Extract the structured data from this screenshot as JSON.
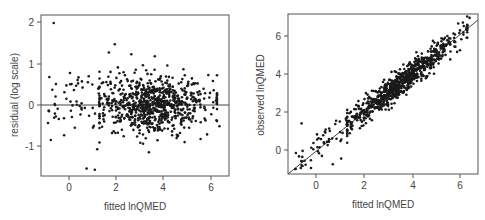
{
  "chart_data": [
    {
      "type": "scatter",
      "title": "",
      "xlabel": "fitted lnQMED",
      "ylabel": "residual (log scale)",
      "xlim": [
        -1.2,
        6.7
      ],
      "ylim": [
        -1.75,
        2.15
      ],
      "xticks": [
        0,
        2,
        4,
        6
      ],
      "yticks": [
        -1,
        0,
        1,
        2
      ],
      "reference_line": {
        "type": "horizontal",
        "y": 0
      },
      "grid": false,
      "legend": null,
      "notable_points": [
        {
          "x": -0.65,
          "y": 2.0
        },
        {
          "x": 1.95,
          "y": 1.48
        },
        {
          "x": 1.7,
          "y": 1.28
        },
        {
          "x": 2.65,
          "y": 1.24
        },
        {
          "x": 3.65,
          "y": 1.19
        },
        {
          "x": 0.75,
          "y": -1.55
        },
        {
          "x": 1.1,
          "y": -1.58
        },
        {
          "x": 1.2,
          "y": -1.08
        },
        {
          "x": 3.4,
          "y": -1.15
        },
        {
          "x": -0.85,
          "y": -0.15
        },
        {
          "x": 6.4,
          "y": -0.52
        }
      ],
      "description": "About 900 points scattered around residual 0, spread roughly -1 to +1, densest between fitted 2 and 5.5"
    },
    {
      "type": "scatter",
      "title": "",
      "xlabel": "fitted lnQMED",
      "ylabel": "observed lnQMED",
      "xlim": [
        -1.2,
        6.7
      ],
      "ylim": [
        -1.2,
        7.2
      ],
      "xticks": [
        0,
        2,
        4,
        6
      ],
      "yticks": [
        0,
        2,
        4,
        6
      ],
      "reference_line": {
        "type": "identity",
        "from": [
          -1.2,
          -1.2
        ],
        "to": [
          6.7,
          6.7
        ]
      },
      "grid": false,
      "legend": null,
      "notable_points": [
        {
          "x": -0.6,
          "y": 1.4
        },
        {
          "x": 0.7,
          "y": -0.75
        },
        {
          "x": 1.05,
          "y": -0.45
        },
        {
          "x": -0.85,
          "y": -1.0
        },
        {
          "x": 6.4,
          "y": 6.95
        },
        {
          "x": 6.0,
          "y": 5.25
        }
      ],
      "description": "About 900 points tightly clustered along the 1:1 line from about -1 to 7"
    }
  ],
  "left_plot": {
    "ylabel": "residual (log scale)",
    "xlabel": "fitted lnQMED",
    "xtick_labels": [
      "0",
      "2",
      "4",
      "6"
    ],
    "ytick_labels": [
      "-1",
      "0",
      "1",
      "2"
    ]
  },
  "right_plot": {
    "ylabel": "observed lnQMED",
    "xlabel": "fitted lnQMED",
    "xtick_labels": [
      "0",
      "2",
      "4",
      "6"
    ],
    "ytick_labels": [
      "0",
      "2",
      "4",
      "6"
    ]
  },
  "colors": {
    "points": "#1a1a1a",
    "axes": "#555555",
    "text": "#444444"
  }
}
